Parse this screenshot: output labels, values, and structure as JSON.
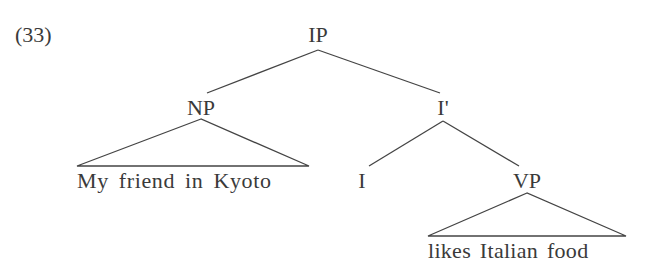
{
  "example_number": "(33)",
  "tree": {
    "root": "IP",
    "nodes": {
      "ip": "IP",
      "np": "NP",
      "ibar": "I'",
      "i": "I",
      "vp": "VP"
    },
    "leaves": {
      "np_phrase": "My friend in Kyoto",
      "vp_phrase": "likes Italian food"
    },
    "structure": "[IP [NP My friend in Kyoto] [I' [I] [VP likes Italian food]]]"
  },
  "colors": {
    "line": "#444444",
    "text": "#3a3a3a",
    "background": "#ffffff"
  }
}
